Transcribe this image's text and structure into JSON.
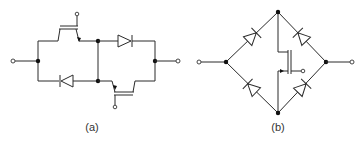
{
  "figure": {
    "panels": [
      {
        "id": "a",
        "label": "(a)",
        "description": "Bidirectional switch: two IGBTs with two series diodes in anti-parallel arrangement",
        "components": [
          "igbt-top",
          "igbt-bottom",
          "diode-top",
          "diode-bottom"
        ],
        "terminals": [
          "left",
          "right",
          "gate-top",
          "gate-bottom"
        ]
      },
      {
        "id": "b",
        "label": "(b)",
        "description": "Diode bridge with single MOSFET bidirectional switch",
        "components": [
          "diode-upper-left",
          "diode-lower-left",
          "diode-upper-right",
          "diode-lower-right",
          "mosfet-center"
        ],
        "terminals": [
          "left",
          "right",
          "gate"
        ]
      }
    ],
    "colors": {
      "line": "#2a2a2a",
      "background": "#ffffff"
    }
  }
}
